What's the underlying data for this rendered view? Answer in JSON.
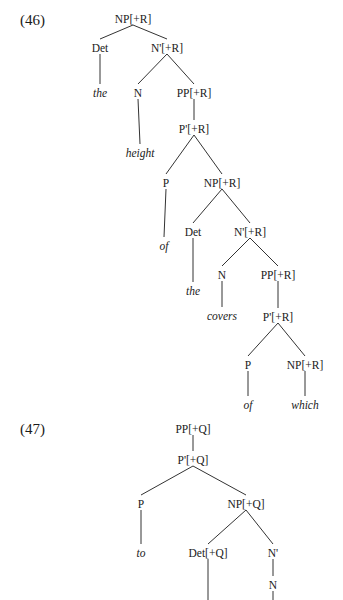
{
  "examples": [
    {
      "label": "(46)",
      "nodes": [
        {
          "id": "n1",
          "text": "NP[+R]",
          "x": 133,
          "y": 19
        },
        {
          "id": "n2",
          "text": "Det",
          "x": 100,
          "y": 48
        },
        {
          "id": "n3",
          "text": "N'[+R]",
          "x": 167,
          "y": 48
        },
        {
          "id": "n4",
          "text": "the",
          "x": 100,
          "y": 93,
          "leaf": true
        },
        {
          "id": "n5",
          "text": "N",
          "x": 138,
          "y": 93
        },
        {
          "id": "n6",
          "text": "PP[+R]",
          "x": 194,
          "y": 93
        },
        {
          "id": "n7",
          "text": "height",
          "x": 140,
          "y": 153,
          "leaf": true
        },
        {
          "id": "n8",
          "text": "P'[+R]",
          "x": 194,
          "y": 129
        },
        {
          "id": "n9",
          "text": "P",
          "x": 166,
          "y": 183
        },
        {
          "id": "n10",
          "text": "NP[+R]",
          "x": 222,
          "y": 183
        },
        {
          "id": "n11",
          "text": "of",
          "x": 164,
          "y": 246,
          "leaf": true
        },
        {
          "id": "n12",
          "text": "Det",
          "x": 193,
          "y": 232
        },
        {
          "id": "n13",
          "text": "N'[+R]",
          "x": 250,
          "y": 232
        },
        {
          "id": "n14",
          "text": "the",
          "x": 193,
          "y": 291,
          "leaf": true
        },
        {
          "id": "n15",
          "text": "N",
          "x": 222,
          "y": 275
        },
        {
          "id": "n16",
          "text": "PP[+R]",
          "x": 278,
          "y": 275
        },
        {
          "id": "n17",
          "text": "covers",
          "x": 222,
          "y": 316,
          "leaf": true
        },
        {
          "id": "n18",
          "text": "P'[+R]",
          "x": 278,
          "y": 317
        },
        {
          "id": "n19",
          "text": "P",
          "x": 248,
          "y": 365
        },
        {
          "id": "n20",
          "text": "NP[+R]",
          "x": 305,
          "y": 365
        },
        {
          "id": "n21",
          "text": "of",
          "x": 248,
          "y": 405,
          "leaf": true
        },
        {
          "id": "n22",
          "text": "which",
          "x": 305,
          "y": 405,
          "leaf": true
        }
      ],
      "edges": [
        [
          "n1",
          "n2"
        ],
        [
          "n1",
          "n3"
        ],
        [
          "n2",
          "n4"
        ],
        [
          "n3",
          "n5"
        ],
        [
          "n3",
          "n6"
        ],
        [
          "n5",
          "n7"
        ],
        [
          "n6",
          "n8"
        ],
        [
          "n8",
          "n9"
        ],
        [
          "n8",
          "n10"
        ],
        [
          "n9",
          "n11"
        ],
        [
          "n10",
          "n12"
        ],
        [
          "n10",
          "n13"
        ],
        [
          "n12",
          "n14"
        ],
        [
          "n13",
          "n15"
        ],
        [
          "n13",
          "n16"
        ],
        [
          "n15",
          "n17"
        ],
        [
          "n16",
          "n18"
        ],
        [
          "n18",
          "n19"
        ],
        [
          "n18",
          "n20"
        ],
        [
          "n19",
          "n21"
        ],
        [
          "n20",
          "n22"
        ]
      ]
    },
    {
      "label": "(47)",
      "nodes": [
        {
          "id": "m1",
          "text": "PP[+Q]",
          "x": 193,
          "y": 429
        },
        {
          "id": "m2",
          "text": "P'[+Q]",
          "x": 193,
          "y": 460
        },
        {
          "id": "m3",
          "text": "P",
          "x": 141,
          "y": 504
        },
        {
          "id": "m4",
          "text": "NP[+Q]",
          "x": 246,
          "y": 504
        },
        {
          "id": "m5",
          "text": "to",
          "x": 141,
          "y": 553,
          "leaf": true
        },
        {
          "id": "m6",
          "text": "Det[+Q]",
          "x": 208,
          "y": 553
        },
        {
          "id": "m7",
          "text": "N'",
          "x": 273,
          "y": 553
        },
        {
          "id": "m8",
          "text": "N",
          "x": 273,
          "y": 585
        }
      ],
      "edges": [
        [
          "m1",
          "m2"
        ],
        [
          "m2",
          "m3"
        ],
        [
          "m2",
          "m4"
        ],
        [
          "m3",
          "m5"
        ],
        [
          "m4",
          "m6"
        ],
        [
          "m4",
          "m7"
        ],
        [
          "m7",
          "m8"
        ],
        [
          "m6",
          "m6_down"
        ],
        [
          "m8",
          "m8_down"
        ]
      ],
      "open_ends": {
        "m6_down": {
          "x": 208,
          "y": 600
        },
        "m8_down": {
          "x": 273,
          "y": 600
        }
      }
    }
  ]
}
